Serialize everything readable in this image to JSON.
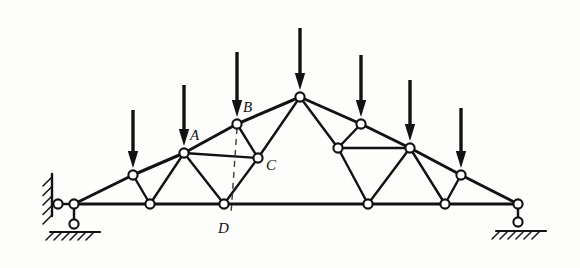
{
  "figure": {
    "type": "engineering-truss-diagram",
    "background_color": "#fdfdfc",
    "line_color": "#121212",
    "node_fill_color": "#ffffff",
    "view_box": "0 0 580 268"
  },
  "labels": [
    {
      "id": "A",
      "text": "A",
      "x": 190,
      "y": 140
    },
    {
      "id": "B",
      "text": "B",
      "x": 243,
      "y": 112
    },
    {
      "id": "C",
      "text": "C",
      "x": 266,
      "y": 170
    },
    {
      "id": "D",
      "text": "D",
      "x": 218,
      "y": 233
    }
  ],
  "joints": {
    "bottom_chord": [
      {
        "id": "L0",
        "x": 74,
        "y": 204
      },
      {
        "id": "L1",
        "x": 150,
        "y": 204
      },
      {
        "id": "L2",
        "x": 224,
        "y": 204,
        "label": "D"
      },
      {
        "id": "L3",
        "x": 368,
        "y": 204
      },
      {
        "id": "L4",
        "x": 445,
        "y": 204
      },
      {
        "id": "L5",
        "x": 518,
        "y": 204
      }
    ],
    "top_chord_left": [
      {
        "id": "T1",
        "x": 133,
        "y": 175
      },
      {
        "id": "T2",
        "x": 184,
        "y": 153,
        "label": "A"
      },
      {
        "id": "T3",
        "x": 237,
        "y": 124,
        "label": "B"
      },
      {
        "id": "APEX",
        "x": 300,
        "y": 97
      }
    ],
    "top_chord_right": [
      {
        "id": "T4",
        "x": 361,
        "y": 124
      },
      {
        "id": "T5",
        "x": 410,
        "y": 148
      },
      {
        "id": "T6",
        "x": 461,
        "y": 175
      }
    ],
    "interior": [
      {
        "id": "C-node",
        "x": 258,
        "y": 158,
        "label": "C"
      },
      {
        "id": "C-mirror",
        "x": 338,
        "y": 148
      }
    ],
    "support_nodes": [
      {
        "id": "SLW",
        "x": 58,
        "y": 204
      },
      {
        "id": "SLB",
        "x": 74,
        "y": 224
      },
      {
        "id": "SRB",
        "x": 518,
        "y": 222
      }
    ]
  },
  "members": {
    "bottom_chord": [
      [
        74,
        204,
        150,
        204
      ],
      [
        150,
        204,
        224,
        204
      ],
      [
        224,
        204,
        368,
        204
      ],
      [
        368,
        204,
        445,
        204
      ],
      [
        445,
        204,
        518,
        204
      ]
    ],
    "top_chord": [
      [
        74,
        204,
        133,
        175
      ],
      [
        133,
        175,
        184,
        153
      ],
      [
        184,
        153,
        237,
        124
      ],
      [
        237,
        124,
        300,
        97
      ],
      [
        300,
        97,
        361,
        124
      ],
      [
        361,
        124,
        410,
        148
      ],
      [
        410,
        148,
        461,
        175
      ],
      [
        461,
        175,
        518,
        204
      ]
    ],
    "web_left": [
      [
        133,
        175,
        150,
        204
      ],
      [
        184,
        153,
        150,
        204
      ],
      [
        184,
        153,
        224,
        204
      ],
      [
        237,
        124,
        258,
        158
      ],
      [
        184,
        153,
        258,
        158
      ],
      [
        258,
        158,
        224,
        204
      ],
      [
        300,
        97,
        258,
        158
      ]
    ],
    "web_right": [
      [
        300,
        97,
        338,
        148
      ],
      [
        361,
        124,
        338,
        148
      ],
      [
        338,
        148,
        410,
        148
      ],
      [
        338,
        148,
        368,
        204
      ],
      [
        410,
        148,
        368,
        204
      ],
      [
        410,
        148,
        445,
        204
      ],
      [
        461,
        175,
        445,
        204
      ]
    ],
    "support_links": [
      [
        58,
        204,
        74,
        204
      ],
      [
        74,
        204,
        74,
        224
      ],
      [
        518,
        204,
        518,
        222
      ]
    ]
  },
  "dashed_line": {
    "description": "vertical section cut from B down past D",
    "x1": 237,
    "y1": 128,
    "x2": 231,
    "y2": 214
  },
  "loads": [
    {
      "id": "P1",
      "x": 133,
      "tail_y": 110,
      "head_y": 168,
      "direction": "down"
    },
    {
      "id": "P2",
      "x": 184,
      "tail_y": 85,
      "head_y": 146,
      "direction": "down"
    },
    {
      "id": "P3",
      "x": 237,
      "tail_y": 52,
      "head_y": 117,
      "direction": "down"
    },
    {
      "id": "P4",
      "x": 300,
      "tail_y": 28,
      "head_y": 90,
      "direction": "down"
    },
    {
      "id": "P5",
      "x": 361,
      "tail_y": 55,
      "head_y": 117,
      "direction": "down"
    },
    {
      "id": "P6",
      "x": 410,
      "tail_y": 80,
      "head_y": 141,
      "direction": "down"
    },
    {
      "id": "P7",
      "x": 461,
      "tail_y": 108,
      "head_y": 168,
      "direction": "down"
    }
  ],
  "supports": {
    "left": {
      "kind": "pin-on-wall-and-roller",
      "wall_x": 52,
      "wall_y1": 174,
      "wall_y2": 216,
      "ground_y": 232,
      "ground_x1": 50,
      "ground_x2": 100,
      "hatch_count_wall": 5,
      "hatch_count_ground": 6
    },
    "right": {
      "kind": "roller-on-ground",
      "ground_y": 231,
      "ground_x1": 496,
      "ground_x2": 546,
      "hatch_count_ground": 6
    }
  }
}
